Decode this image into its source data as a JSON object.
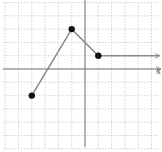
{
  "chart_data": {
    "type": "line",
    "title": "",
    "xlabel": "x",
    "ylabel": "",
    "grid": true,
    "xlim": [
      -6.4,
      5.8
    ],
    "ylim": [
      -5.9,
      5
    ],
    "series": [
      {
        "name": "piecewise function",
        "points": [
          [
            -4,
            -2
          ],
          [
            -1,
            3
          ],
          [
            1,
            1
          ]
        ],
        "closed_endpoints": [
          [
            -4,
            -2
          ],
          [
            -1,
            3
          ],
          [
            1,
            1
          ]
        ],
        "ray": {
          "from": [
            1,
            1
          ],
          "direction": "right",
          "arrow": true
        }
      }
    ],
    "colors": {
      "line": "#888888",
      "point": "#111111",
      "axis": "#777777",
      "grid": "#c8c8c8"
    }
  },
  "axis": {
    "x_label": "x"
  }
}
